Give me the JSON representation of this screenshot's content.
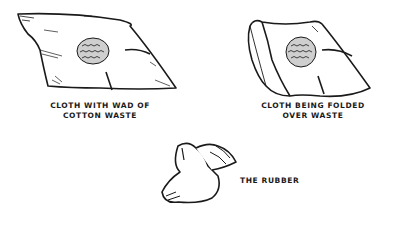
{
  "figures": [
    {
      "id": "flat-cloth",
      "caption_lines": [
        "CLOTH WITH WAD OF",
        "COTTON WASTE"
      ]
    },
    {
      "id": "folding-cloth",
      "caption_lines": [
        "CLOTH BEING FOLDED",
        "OVER WASTE"
      ]
    },
    {
      "id": "rubber",
      "caption_lines": [
        "THE RUBBER"
      ]
    }
  ],
  "colors": {
    "ink": "#1a1a1a",
    "background": "#ffffff"
  }
}
